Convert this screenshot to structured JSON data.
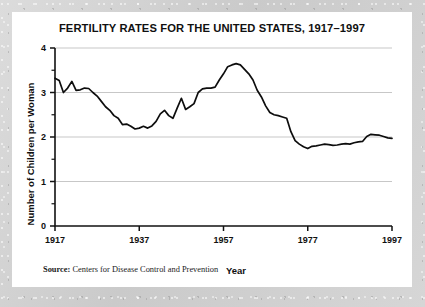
{
  "source": {
    "label": "Source:",
    "text": "Centers for Disease Control and Prevention"
  },
  "chart_data": {
    "type": "line",
    "title": "FERTILITY RATES FOR THE UNITED STATES, 1917–1997",
    "xlabel": "Year",
    "ylabel": "Number of Children per Woman",
    "xlim": [
      1917,
      1997
    ],
    "ylim": [
      0,
      4
    ],
    "xticks": [
      1917,
      1937,
      1957,
      1977,
      1997
    ],
    "xtick_labels": [
      "1917",
      "1937",
      "1957",
      "1977",
      "1997"
    ],
    "yticks": [
      0,
      1,
      2,
      3,
      4
    ],
    "ytick_labels": [
      "0",
      "1",
      "2",
      "3",
      "4"
    ],
    "y_minor_ticks": [
      0.5,
      1.5,
      2.5,
      3.5
    ],
    "grid": "horizontal",
    "legend": "none",
    "line_color": "#0d0d0d",
    "grid_color": "#b9b9b9",
    "axis_color": "#121212",
    "x": [
      1917,
      1918,
      1919,
      1920,
      1921,
      1922,
      1923,
      1924,
      1925,
      1926,
      1927,
      1928,
      1929,
      1930,
      1931,
      1932,
      1933,
      1934,
      1935,
      1936,
      1937,
      1938,
      1939,
      1940,
      1941,
      1942,
      1943,
      1944,
      1945,
      1946,
      1947,
      1948,
      1949,
      1950,
      1951,
      1952,
      1953,
      1954,
      1955,
      1956,
      1957,
      1958,
      1959,
      1960,
      1961,
      1962,
      1963,
      1964,
      1965,
      1966,
      1967,
      1968,
      1969,
      1970,
      1971,
      1972,
      1973,
      1974,
      1975,
      1976,
      1977,
      1978,
      1979,
      1980,
      1981,
      1982,
      1983,
      1984,
      1985,
      1986,
      1987,
      1988,
      1989,
      1990,
      1991,
      1992,
      1993,
      1994,
      1995,
      1996,
      1997
    ],
    "y": [
      3.32,
      3.27,
      3.0,
      3.1,
      3.25,
      3.05,
      3.06,
      3.1,
      3.09,
      3.0,
      2.92,
      2.8,
      2.68,
      2.6,
      2.48,
      2.42,
      2.28,
      2.29,
      2.24,
      2.18,
      2.2,
      2.24,
      2.2,
      2.25,
      2.35,
      2.52,
      2.6,
      2.48,
      2.42,
      2.65,
      2.87,
      2.62,
      2.68,
      2.75,
      3.0,
      3.08,
      3.1,
      3.1,
      3.12,
      3.28,
      3.42,
      3.58,
      3.62,
      3.65,
      3.62,
      3.52,
      3.42,
      3.28,
      3.05,
      2.9,
      2.7,
      2.55,
      2.5,
      2.48,
      2.45,
      2.42,
      2.12,
      1.92,
      1.84,
      1.78,
      1.74,
      1.79,
      1.8,
      1.82,
      1.84,
      1.83,
      1.81,
      1.82,
      1.84,
      1.85,
      1.84,
      1.87,
      1.89,
      1.9,
      2.01,
      2.06,
      2.05,
      2.04,
      2.01,
      1.98,
      1.97
    ]
  }
}
